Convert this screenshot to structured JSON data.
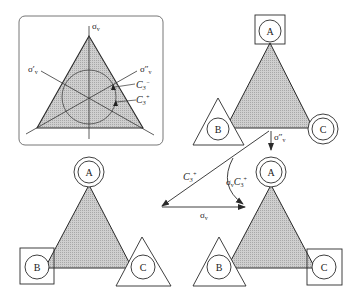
{
  "figure": {
    "colors": {
      "fill": "#c4c4c4",
      "stroke": "#2a2a2a",
      "inset_border": "#555555",
      "background": "#ffffff"
    }
  },
  "inset": {
    "labels": {
      "sigma_v": "σ",
      "sigma_v_sub": "v",
      "sigma_v_prime": "σ′",
      "sigma_v_prime_sub": "v",
      "sigma_v_dprime": "σ″",
      "sigma_v_dprime_sub": "v",
      "c3_minus": "C",
      "c3_minus_sub": "3",
      "c3_minus_sup": "−",
      "c3_plus": "C",
      "c3_plus_sub": "3",
      "c3_plus_sup": "+"
    }
  },
  "triangles": {
    "top_right": {
      "vertices": [
        {
          "label": "A",
          "marker": "square"
        },
        {
          "label": "B",
          "marker": "triangle"
        },
        {
          "label": "C",
          "marker": "double-circle"
        }
      ]
    },
    "bottom_left": {
      "vertices": [
        {
          "label": "A",
          "marker": "double-circle"
        },
        {
          "label": "B",
          "marker": "square"
        },
        {
          "label": "C",
          "marker": "triangle"
        }
      ]
    },
    "bottom_right": {
      "vertices": [
        {
          "label": "A",
          "marker": "double-circle"
        },
        {
          "label": "B",
          "marker": "triangle"
        },
        {
          "label": "C",
          "marker": "square"
        }
      ]
    }
  },
  "arrows": {
    "sigma_v_dprime": {
      "label": "σ″",
      "sub": "v"
    },
    "c3_plus": {
      "label": "C",
      "sub": "3",
      "sup": "+"
    },
    "sigma_v": {
      "label": "σ",
      "sub": "v"
    },
    "sigma_v_c3_plus": {
      "label": "σ",
      "sub": "v",
      "label2": "C",
      "sub2": "3",
      "sup2": "+"
    }
  }
}
